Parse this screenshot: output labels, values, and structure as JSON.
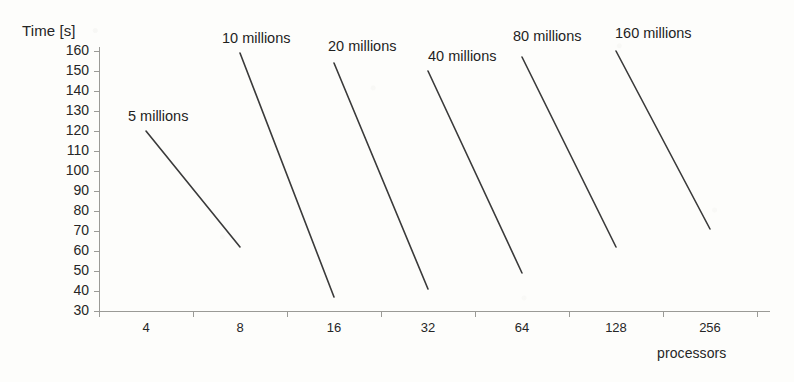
{
  "chart_data": {
    "type": "line",
    "title": "",
    "xlabel": "processors",
    "ylabel": "Time [s]",
    "categories": [
      "4",
      "8",
      "16",
      "32",
      "64",
      "128",
      "256"
    ],
    "yticks": [
      160,
      150,
      140,
      130,
      120,
      110,
      100,
      90,
      80,
      70,
      60,
      50,
      40,
      30
    ],
    "ylim": [
      30,
      160
    ],
    "grid": false,
    "legend_position": "inline-labels",
    "line_color": "#3a3a3a",
    "axis_color": "#9a9a96",
    "series": [
      {
        "name": "5 millions",
        "label": "5 millions",
        "label_x": 128,
        "label_y": 108,
        "points": [
          {
            "x": "4",
            "y": 120
          },
          {
            "x": "8",
            "y": 62
          }
        ]
      },
      {
        "name": "10 millions",
        "label": "10 millions",
        "label_x": 222,
        "label_y": 30,
        "points": [
          {
            "x": "8",
            "y": 159
          },
          {
            "x": "16",
            "y": 37
          }
        ]
      },
      {
        "name": "20 millions",
        "label": "20 millions",
        "label_x": 328,
        "label_y": 38,
        "points": [
          {
            "x": "16",
            "y": 154
          },
          {
            "x": "32",
            "y": 41
          }
        ]
      },
      {
        "name": "40 millions",
        "label": "40 millions",
        "label_x": 428,
        "label_y": 48,
        "points": [
          {
            "x": "32",
            "y": 150
          },
          {
            "x": "64",
            "y": 49
          }
        ]
      },
      {
        "name": "80 millions",
        "label": "80 millions",
        "label_x": 513,
        "label_y": 28,
        "points": [
          {
            "x": "64",
            "y": 157
          },
          {
            "x": "128",
            "y": 62
          }
        ]
      },
      {
        "name": "160 millions",
        "label": "160 millions",
        "label_x": 615,
        "label_y": 25,
        "points": [
          {
            "x": "128",
            "y": 160
          },
          {
            "x": "256",
            "y": 71
          }
        ]
      }
    ]
  },
  "axes": {
    "y_title": "Time [s]",
    "x_title": "processors"
  }
}
